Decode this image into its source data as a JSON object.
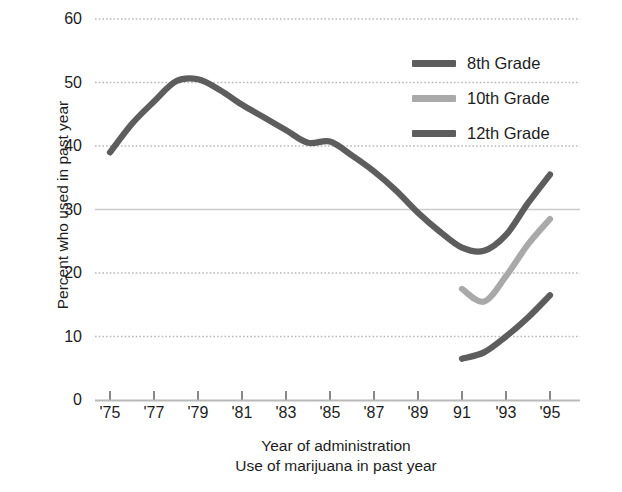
{
  "figure": {
    "caption_remnant": "",
    "background": "#ffffff"
  },
  "chart_data": {
    "type": "line",
    "title": "",
    "subtitle": "",
    "xlabel": "Year of administration",
    "xlabel_secondary": "Use of marijuana in past year",
    "ylabel": "Percent who used in past year",
    "xlim": [
      1975,
      1995
    ],
    "ylim": [
      0,
      60
    ],
    "ytick_values": [
      0,
      10,
      20,
      30,
      40,
      50,
      60
    ],
    "ytick_labels": [
      "0",
      "10",
      "20",
      "30",
      "40",
      "50",
      "60"
    ],
    "xtick_values": [
      1975,
      1977,
      1979,
      1981,
      1983,
      1985,
      1987,
      1989,
      1991,
      1993,
      1995
    ],
    "xtick_labels": [
      "'75",
      "'77",
      "'79",
      "'81",
      "'83",
      "'85",
      "'87",
      "'89",
      "91",
      "'93",
      "'95"
    ],
    "grid": true,
    "grid_style": "dotted",
    "grid_color": "#b9b9b9",
    "legend_position": "upper right",
    "series": [
      {
        "name": "8th Grade",
        "color": "#5d5d5d",
        "x": [
          1991,
          1992,
          1993,
          1994,
          1995
        ],
        "values": [
          6.5,
          7.5,
          10.0,
          13.0,
          16.5
        ]
      },
      {
        "name": "10th Grade",
        "color": "#a9a9a9",
        "x": [
          1991,
          1992,
          1993,
          1994,
          1995
        ],
        "values": [
          17.5,
          15.5,
          19.5,
          24.5,
          28.5
        ]
      },
      {
        "name": "12th Grade",
        "color": "#5d5d5d",
        "x": [
          1975,
          1976,
          1977,
          1978,
          1979,
          1980,
          1981,
          1982,
          1983,
          1984,
          1985,
          1986,
          1987,
          1988,
          1989,
          1990,
          1991,
          1992,
          1993,
          1994,
          1995
        ],
        "values": [
          39.0,
          43.5,
          47.0,
          50.2,
          50.5,
          48.8,
          46.5,
          44.5,
          42.5,
          40.5,
          40.7,
          38.5,
          36.0,
          33.0,
          29.5,
          26.5,
          24.0,
          23.5,
          26.0,
          31.0,
          35.5
        ]
      }
    ]
  },
  "legend": {
    "items": [
      {
        "label": "8th Grade",
        "color": "#5d5d5d"
      },
      {
        "label": "10th Grade",
        "color": "#a9a9a9"
      },
      {
        "label": "12th Grade",
        "color": "#5d5d5d"
      }
    ]
  }
}
